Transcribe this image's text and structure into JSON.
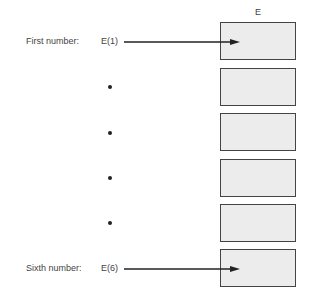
{
  "array": {
    "name": "E",
    "cells": 6
  },
  "labels": {
    "first_caption": "First number:",
    "first_ref": "E(1)",
    "last_caption": "Sixth number:",
    "last_ref": "E(6)"
  },
  "ellipsis_dots": 4
}
